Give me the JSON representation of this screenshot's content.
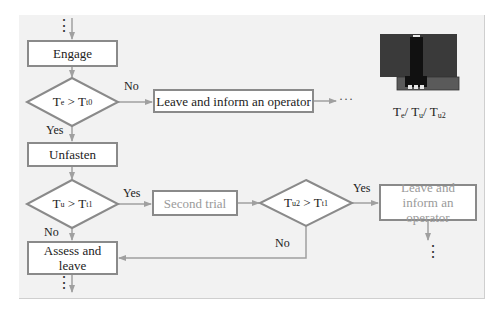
{
  "diagram": {
    "nodes": {
      "engage": "Engage",
      "decision1": {
        "lhs": "T",
        "lhs_sub": "e",
        "op": " > ",
        "rhs": "T",
        "rhs_sub": "t0"
      },
      "leave_inform_1": "Leave and inform an operator",
      "unfasten": "Unfasten",
      "decision2": {
        "lhs": "T",
        "lhs_sub": "u",
        "op": " > ",
        "rhs": "T",
        "rhs_sub": "t1"
      },
      "second_trial": "Second trial",
      "decision3": {
        "lhs": "T",
        "lhs_sub": "u2",
        "op": " > ",
        "rhs": "T",
        "rhs_sub": "t1"
      },
      "leave_inform_2": "Leave and inform an operator",
      "assess_leave": "Assess and leave"
    },
    "edge_labels": {
      "d1_no": "No",
      "d1_yes": "Yes",
      "d2_yes": "Yes",
      "d2_no": "No",
      "d3_yes": "Yes",
      "d3_no": "No"
    },
    "continuation": {
      "vertical": "⋮",
      "horizontal": "···"
    },
    "illustration": {
      "caption_parts": [
        {
          "t": "T",
          "s": "e"
        },
        {
          "t": "/ T",
          "s": "u"
        },
        {
          "t": "/ T",
          "s": "u2"
        }
      ],
      "colors": {
        "body": "#3a3a3a",
        "bolt": "#111111",
        "plate": "#5a5a5a",
        "highlight": "#e8e8e8"
      }
    },
    "colors": {
      "panel": "#f2f2f2",
      "box_border": "#8a8a8a",
      "arrow": "#a0a0a0",
      "gray_text": "#9a9a9a"
    }
  }
}
